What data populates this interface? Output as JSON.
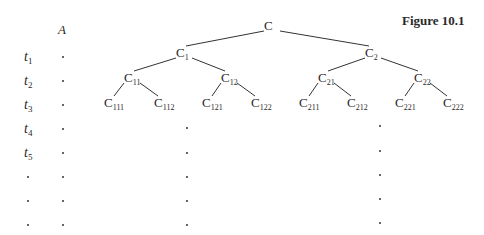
{
  "figure": {
    "title": "Figure 10.1",
    "column_header": "A",
    "row_labels": [
      {
        "base": "t",
        "sub": "1"
      },
      {
        "base": "t",
        "sub": "2"
      },
      {
        "base": "t",
        "sub": "3"
      },
      {
        "base": "t",
        "sub": "4"
      },
      {
        "base": "t",
        "sub": "5"
      },
      {
        "base": "·",
        "sub": ""
      },
      {
        "base": "·",
        "sub": ""
      },
      {
        "base": "·",
        "sub": ""
      }
    ],
    "column_a_dots": 8,
    "tree": {
      "nodes": [
        {
          "id": "C",
          "base": "C",
          "sub": "",
          "level": 0
        },
        {
          "id": "C1",
          "base": "C",
          "sub": "1",
          "level": 1,
          "parent": "C"
        },
        {
          "id": "C2",
          "base": "C",
          "sub": "2",
          "level": 1,
          "parent": "C"
        },
        {
          "id": "C11",
          "base": "C",
          "sub": "11",
          "level": 2,
          "parent": "C1"
        },
        {
          "id": "C12",
          "base": "C",
          "sub": "12",
          "level": 2,
          "parent": "C1"
        },
        {
          "id": "C21",
          "base": "C",
          "sub": "21",
          "level": 2,
          "parent": "C2"
        },
        {
          "id": "C22",
          "base": "C",
          "sub": "22",
          "level": 2,
          "parent": "C2"
        },
        {
          "id": "C111",
          "base": "C",
          "sub": "111",
          "level": 3,
          "parent": "C11"
        },
        {
          "id": "C112",
          "base": "C",
          "sub": "112",
          "level": 3,
          "parent": "C11"
        },
        {
          "id": "C121",
          "base": "C",
          "sub": "121",
          "level": 3,
          "parent": "C12"
        },
        {
          "id": "C122",
          "base": "C",
          "sub": "122",
          "level": 3,
          "parent": "C12"
        },
        {
          "id": "C211",
          "base": "C",
          "sub": "211",
          "level": 3,
          "parent": "C21"
        },
        {
          "id": "C212",
          "base": "C",
          "sub": "212",
          "level": 3,
          "parent": "C21"
        },
        {
          "id": "C221",
          "base": "C",
          "sub": "221",
          "level": 3,
          "parent": "C22"
        },
        {
          "id": "C222",
          "base": "C",
          "sub": "222",
          "level": 3,
          "parent": "C22"
        }
      ]
    },
    "continuation_dot_columns": 2,
    "continuation_dots_per_column": 5
  }
}
